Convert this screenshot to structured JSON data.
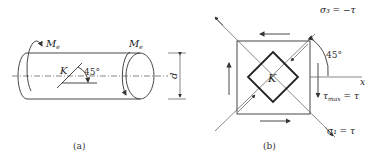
{
  "figure_a": {
    "caption": "(a)",
    "moment_left": "Me",
    "moment_left_main": "M",
    "moment_left_sub": "e",
    "moment_right_main": "M",
    "moment_right_sub": "e",
    "point_label": "K",
    "angle_label": "45°",
    "diameter_label": "d"
  },
  "figure_b": {
    "caption": "(b)",
    "point_label": "K",
    "angle_label": "45°",
    "axis_label": "x",
    "sigma3_label": "σ₃ = −τ",
    "sigma1_label": "σ₁ = τ",
    "tau_label": "τmax = τ",
    "tau_main": "τ",
    "tau_sub": "max",
    "tau_rhs": " = τ"
  }
}
